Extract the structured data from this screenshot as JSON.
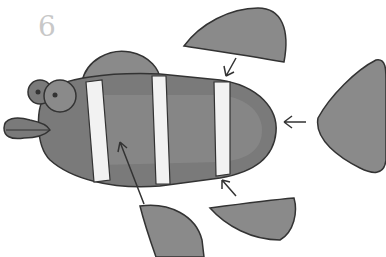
{
  "diagram": {
    "step_number": "6",
    "parts": [
      {
        "name": "top-fin",
        "arrow_to": "body-top"
      },
      {
        "name": "tail-fin",
        "arrow_to": "body-tail"
      },
      {
        "name": "bottom-left-fin",
        "arrow_to": "body-side"
      },
      {
        "name": "bottom-right-fin",
        "arrow_to": "body-bottom"
      }
    ],
    "colors": {
      "fill": "#8a8a8a",
      "fill_dark": "#6e6e6e",
      "stripe": "#f2f2f2",
      "outline": "#333333",
      "number": "#c8c8c8"
    }
  }
}
